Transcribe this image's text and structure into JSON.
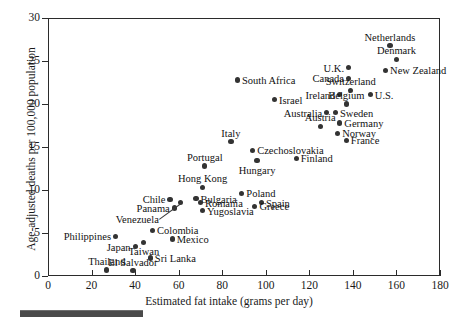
{
  "chart_data": {
    "type": "scatter",
    "title": "",
    "xlabel": "Estimated fat intake (grams per day)",
    "ylabel": "Age-adjusted deaths per 100,000 population",
    "xlim": [
      0,
      180
    ],
    "ylim": [
      0,
      30
    ],
    "xticks": [
      0,
      20,
      40,
      60,
      80,
      100,
      120,
      140,
      160,
      180
    ],
    "yticks": [
      0,
      5,
      10,
      15,
      20,
      25,
      30
    ],
    "grid": false,
    "legend": null,
    "marker_color": "#333333",
    "axis_color": "#2b2b2b",
    "points": [
      {
        "label": "Netherlands",
        "x": 157,
        "y": 26.8,
        "pos": "above"
      },
      {
        "label": "Denmark",
        "x": 160,
        "y": 25.2,
        "pos": "above"
      },
      {
        "label": "New Zealand",
        "x": 155,
        "y": 23.9,
        "pos": "right"
      },
      {
        "label": "U.K.",
        "x": 138,
        "y": 24.2,
        "pos": "left"
      },
      {
        "label": "Canada",
        "x": 138,
        "y": 23.0,
        "pos": "left"
      },
      {
        "label": "Switzerland",
        "x": 139,
        "y": 21.6,
        "pos": "above"
      },
      {
        "label": "Ireland",
        "x": 134,
        "y": 21.1,
        "pos": "left"
      },
      {
        "label": "U.S.",
        "x": 148,
        "y": 21.1,
        "pos": "right"
      },
      {
        "label": "Belgium",
        "x": 137,
        "y": 20.0,
        "pos": "above"
      },
      {
        "label": "Sweden",
        "x": 132,
        "y": 19.0,
        "pos": "right"
      },
      {
        "label": "Australia",
        "x": 128,
        "y": 19.0,
        "pos": "left"
      },
      {
        "label": "Germany",
        "x": 134,
        "y": 17.8,
        "pos": "right"
      },
      {
        "label": "Austria",
        "x": 125,
        "y": 17.4,
        "pos": "above"
      },
      {
        "label": "Norway",
        "x": 133,
        "y": 16.6,
        "pos": "right"
      },
      {
        "label": "France",
        "x": 137,
        "y": 15.8,
        "pos": "right"
      },
      {
        "label": "South Africa",
        "x": 87,
        "y": 22.8,
        "pos": "right"
      },
      {
        "label": "Israel",
        "x": 104,
        "y": 20.5,
        "pos": "right"
      },
      {
        "label": "Italy",
        "x": 84,
        "y": 15.6,
        "pos": "above"
      },
      {
        "label": "Czechoslovakia",
        "x": 94,
        "y": 14.6,
        "pos": "right"
      },
      {
        "label": "Finland",
        "x": 114,
        "y": 13.7,
        "pos": "right"
      },
      {
        "label": "Hungary",
        "x": 96,
        "y": 13.4,
        "pos": "below"
      },
      {
        "label": "Portugal",
        "x": 72,
        "y": 12.8,
        "pos": "above"
      },
      {
        "label": "Hong Kong",
        "x": 71,
        "y": 10.3,
        "pos": "above"
      },
      {
        "label": "Poland",
        "x": 89,
        "y": 9.6,
        "pos": "right"
      },
      {
        "label": "Bulgaria",
        "x": 68,
        "y": 9.0,
        "pos": "right"
      },
      {
        "label": "Chile",
        "x": 56,
        "y": 8.9,
        "pos": "left"
      },
      {
        "label": "Romania",
        "x": 70,
        "y": 8.5,
        "pos": "right"
      },
      {
        "label": "Panama",
        "x": 58,
        "y": 7.9,
        "pos": "left"
      },
      {
        "label": "Venezuela",
        "x": 61,
        "y": 8.5,
        "pos": "leader"
      },
      {
        "label": "Yugoslavia",
        "x": 71,
        "y": 7.6,
        "pos": "right"
      },
      {
        "label": "Spain",
        "x": 98,
        "y": 8.5,
        "pos": "right"
      },
      {
        "label": "Greece",
        "x": 95,
        "y": 8.1,
        "pos": "right"
      },
      {
        "label": "Colombia",
        "x": 48,
        "y": 5.3,
        "pos": "right"
      },
      {
        "label": "Mexico",
        "x": 57,
        "y": 4.3,
        "pos": "right"
      },
      {
        "label": "Philippines",
        "x": 31,
        "y": 4.6,
        "pos": "left"
      },
      {
        "label": "Taiwan",
        "x": 44,
        "y": 3.9,
        "pos": "below"
      },
      {
        "label": "Japan",
        "x": 40,
        "y": 3.4,
        "pos": "left"
      },
      {
        "label": "Sri Lanka",
        "x": 47,
        "y": 2.1,
        "pos": "right"
      },
      {
        "label": "Thailand",
        "x": 27,
        "y": 0.7,
        "pos": "above"
      },
      {
        "label": "El Salvador",
        "x": 39,
        "y": 0.6,
        "pos": "above"
      }
    ]
  }
}
